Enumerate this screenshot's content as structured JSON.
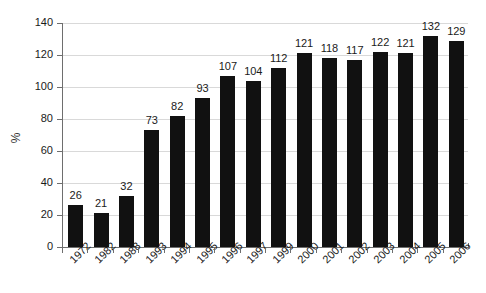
{
  "chart_data": {
    "type": "bar",
    "title": "",
    "subtitle": "",
    "xlabel": "",
    "ylabel": "%",
    "categories": [
      "1972",
      "1982",
      "1988",
      "1993",
      "1994",
      "1995",
      "1996",
      "1997",
      "1999",
      "2000",
      "2001",
      "2002",
      "2003",
      "2004",
      "2005",
      "2006"
    ],
    "values": [
      26,
      21,
      32,
      73,
      82,
      93,
      107,
      104,
      112,
      121,
      118,
      117,
      122,
      121,
      132,
      129
    ],
    "ylim": [
      0,
      140
    ],
    "ytick_step": 20,
    "yticks": [
      "0",
      "20",
      "40",
      "60",
      "80",
      "100",
      "120",
      "140"
    ],
    "grid": true,
    "legend": "none",
    "bar_color": "#111111",
    "grid_color": "#d9d9d9",
    "axis_color": "#6e6e6e",
    "data_labels": true
  }
}
